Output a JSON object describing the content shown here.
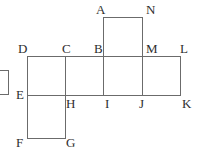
{
  "figure": {
    "name": "polyomino-net",
    "background_color": "#ffffff",
    "stroke_color": "#6b6b6b",
    "stroke_width": 1,
    "label_color": "#2e2e2e",
    "grid_unit_px": 38.5,
    "description_labels_count": 14
  },
  "segments": [
    {
      "name": "top-square-top-edge",
      "x1": 103.5,
      "y1": 17.5,
      "x2": 142.5,
      "y2": 17.5
    },
    {
      "name": "top-square-left-edge",
      "x1": 103.5,
      "y1": 17.5,
      "x2": 103.5,
      "y2": 56.5
    },
    {
      "name": "top-square-right-edge",
      "x1": 142.5,
      "y1": 17.5,
      "x2": 142.5,
      "y2": 56.5
    },
    {
      "name": "middle-row-top-edge",
      "x1": 27.5,
      "y1": 56.5,
      "x2": 180.5,
      "y2": 56.5
    },
    {
      "name": "middle-row-bottom-edge",
      "x1": 27.5,
      "y1": 95.5,
      "x2": 180.5,
      "y2": 95.5
    },
    {
      "name": "middle-row-left-edge",
      "x1": 27.5,
      "y1": 56.5,
      "x2": 27.5,
      "y2": 95.5
    },
    {
      "name": "middle-row-right-edge",
      "x1": 180.5,
      "y1": 56.5,
      "x2": 180.5,
      "y2": 95.5
    },
    {
      "name": "divider-c-h",
      "x1": 65.5,
      "y1": 56.5,
      "x2": 65.5,
      "y2": 95.5
    },
    {
      "name": "divider-b-i",
      "x1": 103.5,
      "y1": 56.5,
      "x2": 103.5,
      "y2": 95.5
    },
    {
      "name": "divider-m-j",
      "x1": 142.5,
      "y1": 56.5,
      "x2": 142.5,
      "y2": 95.5
    },
    {
      "name": "bottom-square-left-edge",
      "x1": 27.5,
      "y1": 95.5,
      "x2": 27.5,
      "y2": 138.5
    },
    {
      "name": "bottom-square-right-edge",
      "x1": 65.5,
      "y1": 95.5,
      "x2": 65.5,
      "y2": 138.5
    },
    {
      "name": "bottom-square-bottom-edge",
      "x1": 27.5,
      "y1": 138.5,
      "x2": 65.5,
      "y2": 138.5
    },
    {
      "name": "cropped-left-shape-right-edge",
      "x1": 8.5,
      "y1": 70.5,
      "x2": 8.5,
      "y2": 94.5
    },
    {
      "name": "cropped-left-shape-top-edge",
      "x1": 0,
      "y1": 70.5,
      "x2": 8.5,
      "y2": 70.5
    },
    {
      "name": "cropped-left-shape-bottom-edge",
      "x1": 0,
      "y1": 94.5,
      "x2": 8.5,
      "y2": 94.5
    }
  ],
  "labels": [
    {
      "key": "A",
      "text": "A",
      "x": 96,
      "y": 3,
      "name": "vertex-label-a"
    },
    {
      "key": "N",
      "text": "N",
      "x": 146,
      "y": 3,
      "name": "vertex-label-n"
    },
    {
      "key": "D",
      "text": "D",
      "x": 18,
      "y": 42,
      "name": "vertex-label-d"
    },
    {
      "key": "C",
      "text": "C",
      "x": 62,
      "y": 42,
      "name": "vertex-label-c"
    },
    {
      "key": "B",
      "text": "B",
      "x": 94,
      "y": 42,
      "name": "vertex-label-b"
    },
    {
      "key": "M",
      "text": "M",
      "x": 146,
      "y": 42,
      "name": "vertex-label-m"
    },
    {
      "key": "L",
      "text": "L",
      "x": 180,
      "y": 42,
      "name": "vertex-label-l"
    },
    {
      "key": "E",
      "text": "E",
      "x": 16,
      "y": 88,
      "name": "vertex-label-e"
    },
    {
      "key": "H",
      "text": "H",
      "x": 66,
      "y": 97,
      "name": "vertex-label-h"
    },
    {
      "key": "I",
      "text": "I",
      "x": 105,
      "y": 97,
      "name": "vertex-label-i"
    },
    {
      "key": "J",
      "text": "J",
      "x": 139,
      "y": 97,
      "name": "vertex-label-j"
    },
    {
      "key": "K",
      "text": "K",
      "x": 182,
      "y": 97,
      "name": "vertex-label-k"
    },
    {
      "key": "F",
      "text": "F",
      "x": 16,
      "y": 136,
      "name": "vertex-label-f"
    },
    {
      "key": "G",
      "text": "G",
      "x": 66,
      "y": 136,
      "name": "vertex-label-g"
    }
  ]
}
